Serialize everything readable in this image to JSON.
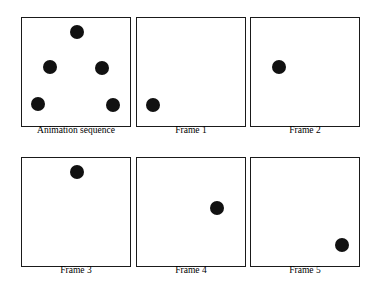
{
  "figure": {
    "background_color": "#ffffff",
    "border_color": "#1a1a1a",
    "dot_color": "#111111",
    "label_color": "#000000",
    "width": 375,
    "height": 294,
    "panel_size": 110,
    "border_width": 1.6,
    "dot_diameter": 14,
    "label_font_size": 9.5
  },
  "panels": [
    {
      "id": "animation-sequence",
      "label": "Animation sequence",
      "x": 21,
      "y": 17,
      "label_y": 126,
      "dots": [
        {
          "name": "dot-frame-3-position",
          "cx": 55,
          "cy": 14
        },
        {
          "name": "dot-frame-2-position",
          "cx": 28,
          "cy": 49
        },
        {
          "name": "dot-frame-4-position",
          "cx": 80,
          "cy": 50
        },
        {
          "name": "dot-frame-1-position",
          "cx": 16,
          "cy": 86
        },
        {
          "name": "dot-frame-5-position",
          "cx": 91,
          "cy": 87
        }
      ]
    },
    {
      "id": "frame-1",
      "label": "Frame 1",
      "x": 136,
      "y": 17,
      "label_y": 126,
      "dots": [
        {
          "name": "dot-frame-1",
          "cx": 16,
          "cy": 87
        }
      ]
    },
    {
      "id": "frame-2",
      "label": "Frame 2",
      "x": 250,
      "y": 17,
      "label_y": 126,
      "dots": [
        {
          "name": "dot-frame-2",
          "cx": 28,
          "cy": 49
        }
      ]
    },
    {
      "id": "frame-3",
      "label": "Frame 3",
      "x": 21,
      "y": 157,
      "label_y": 266,
      "dots": [
        {
          "name": "dot-frame-3",
          "cx": 55,
          "cy": 14
        }
      ]
    },
    {
      "id": "frame-4",
      "label": "Frame 4",
      "x": 136,
      "y": 157,
      "label_y": 266,
      "dots": [
        {
          "name": "dot-frame-4",
          "cx": 80,
          "cy": 50
        }
      ]
    },
    {
      "id": "frame-5",
      "label": "Frame 5",
      "x": 250,
      "y": 157,
      "label_y": 266,
      "dots": [
        {
          "name": "dot-frame-5",
          "cx": 91,
          "cy": 87
        }
      ]
    }
  ]
}
